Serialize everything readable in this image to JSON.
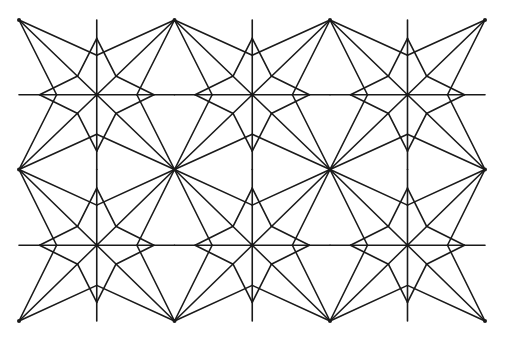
{
  "canvas": {
    "width": 505,
    "height": 342,
    "background": "#ffffff",
    "stroke_color": "#1a1a1a"
  },
  "pattern": {
    "name": "interlaced-four-point-star-tessellation",
    "grid_x": [
      19,
      174.5,
      330,
      485
    ],
    "grid_y": [
      20,
      169.5,
      321
    ],
    "star_centers": [
      {
        "x": 96.5,
        "y": 94.5
      },
      {
        "x": 252,
        "y": 94.5
      },
      {
        "x": 407.5,
        "y": 94.5
      },
      {
        "x": 96.5,
        "y": 245
      },
      {
        "x": 252,
        "y": 245
      },
      {
        "x": 407.5,
        "y": 245
      }
    ],
    "star_tip_offset": 57,
    "star_inner_offset": 19,
    "notch_offset": 40,
    "axis_line_extent": 76,
    "axis_x_extent": 77.5,
    "vertex_dot_radius": 2
  }
}
